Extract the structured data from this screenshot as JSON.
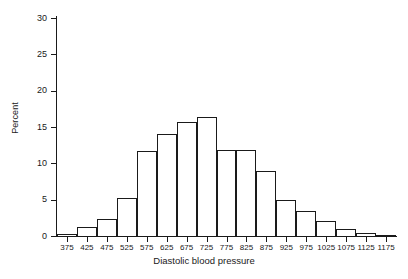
{
  "chart_data": {
    "type": "bar",
    "title": "",
    "subtitle": "",
    "xlabel": "Diastolic blood pressure",
    "ylabel": "Percent",
    "grid": false,
    "legend": "none",
    "categories": [
      "375",
      "425",
      "475",
      "525",
      "575",
      "625",
      "675",
      "725",
      "775",
      "825",
      "875",
      "925",
      "975",
      "1025",
      "1075",
      "1125",
      "1175"
    ],
    "values": [
      0.3,
      1.3,
      2.3,
      5.2,
      11.7,
      14.1,
      15.7,
      16.4,
      11.9,
      11.8,
      8.9,
      5.0,
      3.5,
      2.0,
      1.0,
      0.4,
      0.2
    ],
    "xlim": [
      350,
      1200
    ],
    "ylim": [
      0,
      30
    ],
    "yticks": [
      0,
      5,
      10,
      15,
      20,
      25,
      30
    ],
    "ytick_labels": [
      "0",
      "5",
      "10",
      "15",
      "20",
      "25",
      "30"
    ],
    "bin_width": 50,
    "bar_facecolor": "#ffffff",
    "bar_edgecolor": "#1a1a1a",
    "axis_color": "#1a1a1a",
    "background": "#ffffff"
  }
}
